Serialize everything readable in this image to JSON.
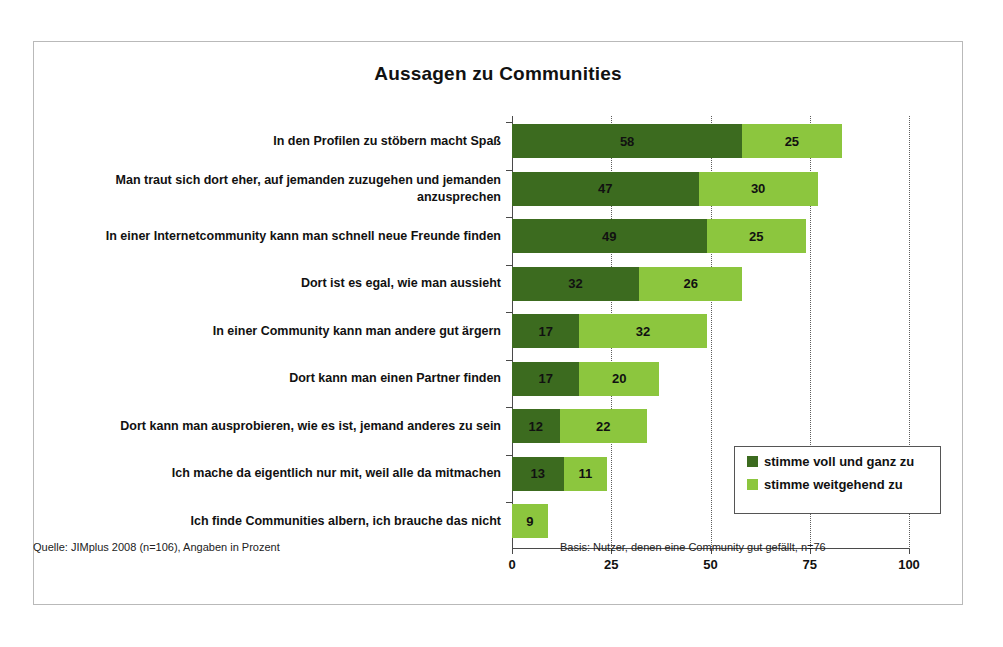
{
  "chart_data": {
    "type": "bar",
    "orientation": "horizontal",
    "stacked": true,
    "title": "Aussagen zu Communities",
    "xlabel": "",
    "ylabel": "",
    "xlim": [
      0,
      100
    ],
    "xticks": [
      "0",
      "25",
      "50",
      "75",
      "100"
    ],
    "xtick_values": [
      0,
      25,
      50,
      75,
      100
    ],
    "grid": "vertical-dotted",
    "legend_position": "inside-right-lower",
    "categories": [
      "In den Profilen zu stöbern macht Spaß",
      "Man traut sich dort eher, auf jemanden zuzugehen und jemanden anzusprechen",
      "In einer Internetcommunity kann man schnell neue Freunde finden",
      "Dort ist es egal, wie man aussieht",
      "In einer Community kann man andere gut ärgern",
      "Dort kann man einen Partner finden",
      "Dort kann man ausprobieren, wie es ist, jemand anderes zu sein",
      "Ich mache da eigentlich nur mit, weil alle da mitmachen",
      "Ich finde Communities albern, ich brauche das nicht"
    ],
    "series": [
      {
        "name": "stimme voll und ganz zu",
        "color": "#3c6b1f",
        "values": [
          58,
          47,
          49,
          32,
          17,
          17,
          12,
          13,
          null
        ]
      },
      {
        "name": "stimme weitgehend zu",
        "color": "#8cc63e",
        "values": [
          25,
          30,
          25,
          26,
          32,
          20,
          22,
          11,
          9
        ]
      }
    ]
  },
  "legend": {
    "items": [
      {
        "label": "stimme voll und ganz zu",
        "color": "#3c6b1f"
      },
      {
        "label": "stimme weitgehend zu",
        "color": "#8cc63e"
      }
    ]
  },
  "footer": {
    "source": "Quelle: JIMplus 2008 (n=106), Angaben in Prozent",
    "basis": "Basis: Nutzer, denen eine Community gut gefällt, n=76"
  }
}
